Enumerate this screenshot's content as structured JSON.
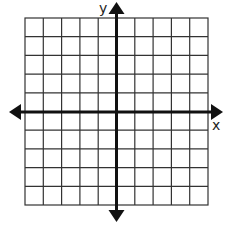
{
  "diagram": {
    "type": "coordinate-plane",
    "grid": {
      "columns": 10,
      "rows": 10,
      "line_color": "#333333",
      "axis_color": "#111111"
    },
    "axes": {
      "x_label": "x",
      "y_label": "y"
    }
  }
}
